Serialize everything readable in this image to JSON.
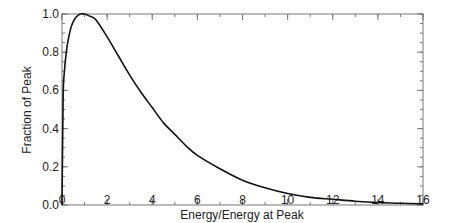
{
  "chart_data": {
    "type": "line",
    "title": "",
    "xlabel": "Energy/Energy at Peak",
    "ylabel": "Fraction of Peak",
    "xlim": [
      0,
      16
    ],
    "ylim": [
      0,
      1.0
    ],
    "grid": false,
    "legend": null,
    "x_ticks": [
      0,
      2,
      4,
      6,
      8,
      10,
      12,
      14,
      16
    ],
    "x_tick_labels": [
      "0",
      "2",
      "4",
      "6",
      "8",
      "10",
      "12",
      "14",
      "16"
    ],
    "x_minor_step": 1,
    "y_ticks": [
      0.0,
      0.2,
      0.4,
      0.6,
      0.8,
      1.0
    ],
    "y_tick_labels": [
      "0.0",
      "0.2",
      "0.4",
      "0.6",
      "0.8",
      "1.0"
    ],
    "y_minor_step": 0.05,
    "series": [
      {
        "name": "spectrum",
        "color": "#111111",
        "x": [
          0,
          0.05,
          0.1,
          0.2,
          0.3,
          0.4,
          0.5,
          0.6,
          0.8,
          1.0,
          1.2,
          1.5,
          2.0,
          2.5,
          3.0,
          3.5,
          4.0,
          4.5,
          5.0,
          5.5,
          6.0,
          7.0,
          8.0,
          9.0,
          10.0,
          11.0,
          12.0,
          13.0,
          14.0,
          15.0,
          16.0
        ],
        "y": [
          0.0,
          0.56,
          0.69,
          0.81,
          0.88,
          0.93,
          0.96,
          0.98,
          1.0,
          1.0,
          0.99,
          0.97,
          0.88,
          0.78,
          0.68,
          0.59,
          0.51,
          0.43,
          0.37,
          0.31,
          0.26,
          0.19,
          0.13,
          0.09,
          0.06,
          0.04,
          0.03,
          0.02,
          0.013,
          0.009,
          0.006
        ]
      }
    ]
  }
}
